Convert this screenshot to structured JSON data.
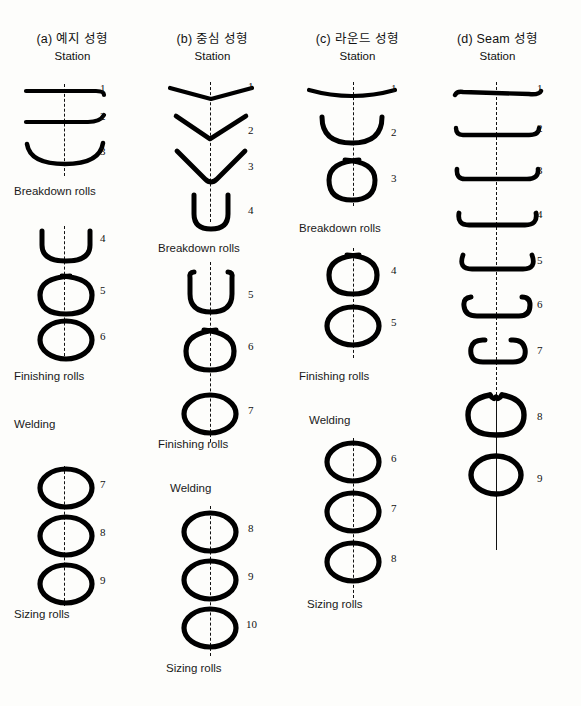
{
  "figure": {
    "caption_a": "(a) 예지 성형",
    "caption_b": "(b) 중심 성형",
    "caption_c": "(c) 라운드 성형",
    "caption_d": "(d) Seam 성형",
    "station_heading": "Station",
    "stroke_color": "#000000",
    "background_color": "#fdfdfb"
  },
  "columns": [
    {
      "id": "a",
      "title": "(a) 예지 성형",
      "subtitle": "Station",
      "stations": [
        "1",
        "2",
        "3",
        "4",
        "5",
        "6",
        "7",
        "8",
        "9"
      ],
      "stage_labels": [
        "Breakdown rolls",
        "Finishing rolls",
        "Welding",
        "Sizing rolls"
      ]
    },
    {
      "id": "b",
      "title": "(b) 중심 성형",
      "subtitle": "Station",
      "stations": [
        "1",
        "2",
        "3",
        "4",
        "5",
        "6",
        "7",
        "8",
        "9",
        "10"
      ],
      "stage_labels": [
        "Breakdown rolls",
        "Finishing rolls",
        "Welding",
        "Sizing rolls"
      ]
    },
    {
      "id": "c",
      "title": "(c) 라운드 성형",
      "subtitle": "Station",
      "stations": [
        "1",
        "2",
        "3",
        "4",
        "5",
        "6",
        "7",
        "8"
      ],
      "stage_labels": [
        "Breakdown rolls",
        "Finishing rolls",
        "Welding",
        "Sizing rolls"
      ]
    },
    {
      "id": "d",
      "title": "(d) Seam 성형",
      "subtitle": "Station",
      "stations": [
        "1",
        "2",
        "3",
        "4",
        "5",
        "6",
        "7",
        "8",
        "9"
      ],
      "stage_labels": []
    }
  ]
}
